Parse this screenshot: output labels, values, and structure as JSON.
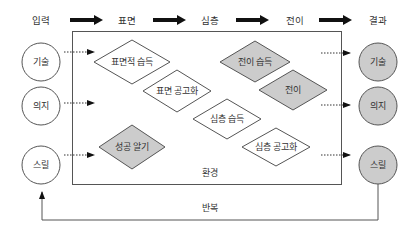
{
  "header": {
    "stages": [
      {
        "label": "입력",
        "x": 41
      },
      {
        "label": "표면",
        "x": 127
      },
      {
        "label": "심층",
        "x": 210
      },
      {
        "label": "전이",
        "x": 295
      },
      {
        "label": "결과",
        "x": 378
      }
    ]
  },
  "environment": {
    "label": "환경"
  },
  "inputs": [
    {
      "label": "기술",
      "cy": 62
    },
    {
      "label": "의지",
      "cy": 106
    },
    {
      "label": "스릴",
      "cy": 165
    }
  ],
  "outputs": [
    {
      "label": "기술",
      "cy": 62
    },
    {
      "label": "의지",
      "cy": 106
    },
    {
      "label": "스릴",
      "cy": 165
    }
  ],
  "nodes": [
    {
      "label": "표면적 습득",
      "cx": 132,
      "cy": 62,
      "shaded": false
    },
    {
      "label": "표면 공고화",
      "cx": 177,
      "cy": 91,
      "shaded": false
    },
    {
      "label": "성공 알기",
      "cx": 132,
      "cy": 147,
      "shaded": true
    },
    {
      "label": "전이 습득",
      "cx": 255,
      "cy": 62,
      "shaded": true
    },
    {
      "label": "전이",
      "cx": 293,
      "cy": 90,
      "shaded": true
    },
    {
      "label": "심층 습득",
      "cx": 227,
      "cy": 119,
      "shaded": false
    },
    {
      "label": "심층 공고화",
      "cx": 276,
      "cy": 147,
      "shaded": false
    }
  ],
  "feedback": {
    "label": "반복"
  },
  "colors": {
    "line": "#555555",
    "shade": "#cccccc",
    "text": "#333333"
  }
}
